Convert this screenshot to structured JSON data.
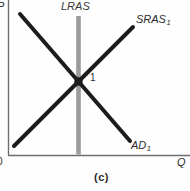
{
  "figure": {
    "caption": "(c)",
    "axes": {
      "y_label": "P",
      "x_label": "Q",
      "origin_label": "0",
      "color": "#6e6e6e"
    },
    "curves": {
      "lras": {
        "label": "LRAS",
        "color": "#9b9b9b"
      },
      "sras": {
        "label": "SRAS",
        "sub": "1",
        "color": "#1c1c1c"
      },
      "ad": {
        "label": "AD",
        "sub": "1",
        "color": "#1c1c1c"
      }
    },
    "points": {
      "equilibrium": {
        "label": "1",
        "color": "#1c1c1c"
      }
    }
  }
}
